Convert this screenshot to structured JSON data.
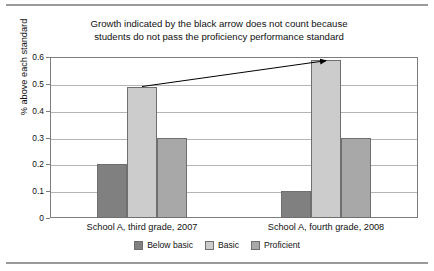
{
  "chart_data": {
    "type": "bar",
    "title": "Growth indicated by the black arrow does not count because students do not pass the proficiency performance standard",
    "title_lines": [
      "Growth indicated by the black arrow does not count because",
      "students do not pass the proficiency performance standard"
    ],
    "xlabel": "",
    "ylabel": "% above each standard",
    "ylim": [
      0,
      0.6
    ],
    "ytick_labels": [
      "0.6",
      "0.5",
      "0.4",
      "0.3",
      "0.2",
      "0.1",
      "0"
    ],
    "ytick_values": [
      0.6,
      0.5,
      0.4,
      0.3,
      0.2,
      0.1,
      0
    ],
    "grid": true,
    "legend_position": "bottom",
    "categories": [
      "School A, third grade, 2007",
      "School A, fourth grade, 2008"
    ],
    "series": [
      {
        "name": "Below basic",
        "color": "#808080",
        "values": [
          0.2,
          0.1
        ]
      },
      {
        "name": "Basic",
        "color": "#cccccc",
        "values": [
          0.49,
          0.59
        ]
      },
      {
        "name": "Proficient",
        "color": "#a8a8a8",
        "values": [
          0.3,
          0.3
        ]
      }
    ],
    "annotations": [
      {
        "name": "growth-arrow",
        "type": "arrow",
        "from_series": "Basic",
        "from_category": "School A, third grade, 2007",
        "to_series": "Basic",
        "to_category": "School A, fourth grade, 2008",
        "from_value": 0.49,
        "to_value": 0.59,
        "color": "#000000"
      }
    ]
  }
}
